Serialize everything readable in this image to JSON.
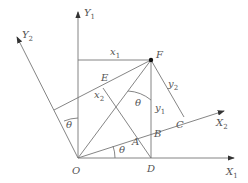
{
  "diagram": {
    "type": "coordinate-rotation",
    "colors": {
      "line": "#777777",
      "text": "#555555",
      "point": "#111111"
    },
    "axes": {
      "X1": {
        "name": "X",
        "sub": "1"
      },
      "Y1": {
        "name": "Y",
        "sub": "1"
      },
      "X2": {
        "name": "X",
        "sub": "2"
      },
      "Y2": {
        "name": "Y",
        "sub": "2"
      }
    },
    "points": {
      "O": "O",
      "A": "A",
      "B": "B",
      "C": "C",
      "D": "D",
      "E": "E",
      "F": "F"
    },
    "segments": {
      "x1": {
        "name": "x",
        "sub": "1"
      },
      "y1": {
        "name": "y",
        "sub": "1"
      },
      "x2": {
        "name": "x",
        "sub": "2"
      },
      "y2": {
        "name": "y",
        "sub": "2"
      }
    },
    "angles": {
      "theta_left": "θ",
      "theta_bottom": "θ",
      "theta_mid": "θ"
    }
  }
}
